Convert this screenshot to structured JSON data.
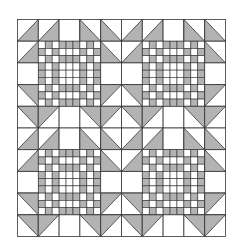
{
  "diagram": {
    "grid_cols": 10,
    "grid_rows": 10,
    "colors": {
      "gray": "#b3b3b3",
      "white": "#ffffff",
      "line": "#333333"
    },
    "cell_legend": {
      "W": "plain white square",
      "br": "half-square triangle, gray lower-right",
      "bl": "half-square triangle, gray lower-left",
      "tr": "half-square triangle, gray upper-right",
      "tl": "half-square triangle, gray upper-left",
      "C": "chain block part"
    },
    "quadrant": [
      [
        "br",
        "br",
        "W",
        "bl",
        "bl"
      ],
      [
        "br",
        "C",
        "C",
        "C",
        "bl"
      ],
      [
        "W",
        "C",
        "C",
        "C",
        "W"
      ],
      [
        "tr",
        "C",
        "C",
        "C",
        "tl"
      ],
      [
        "tr",
        "tl",
        "W",
        "tr",
        "tl"
      ]
    ],
    "chain_block": {
      "corner_patch": [
        [
          0,
          1,
          0
        ],
        [
          1,
          0,
          1
        ],
        [
          0,
          1,
          0
        ]
      ],
      "edge_stripes": [
        1,
        0,
        1
      ],
      "center": "white"
    }
  }
}
